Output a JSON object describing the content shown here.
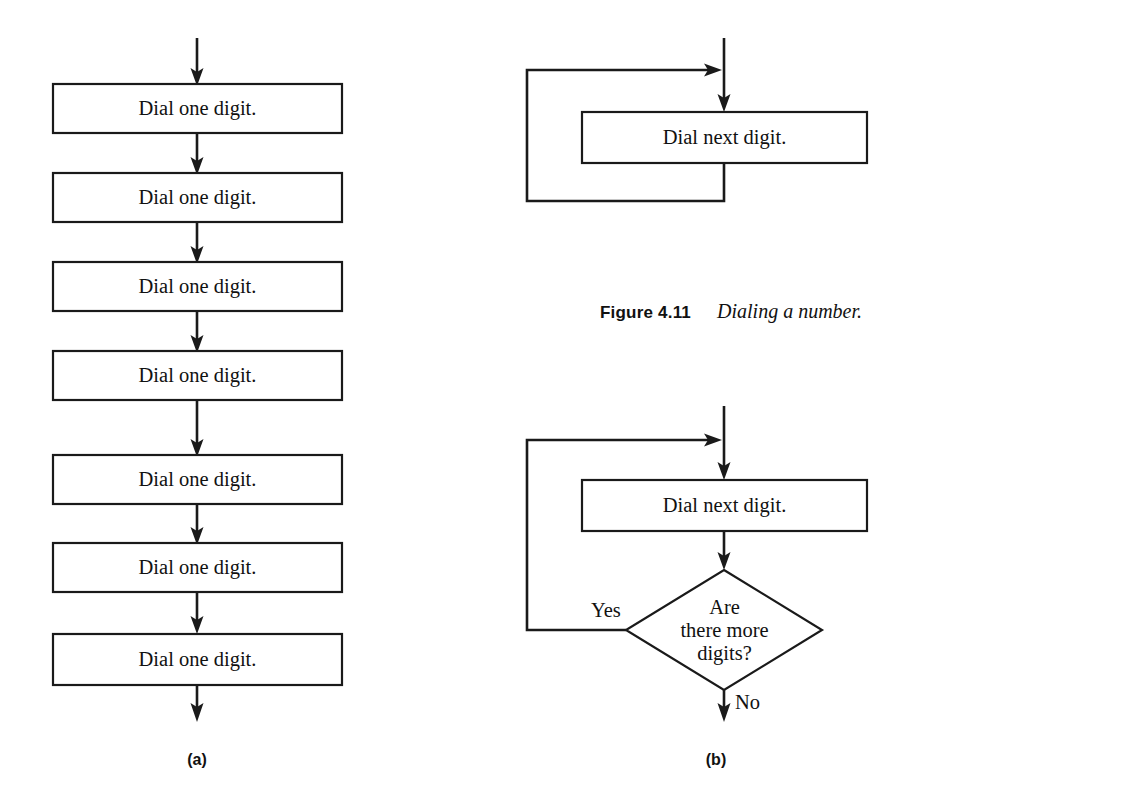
{
  "figure": {
    "caption_number": "Figure 4.11",
    "caption_text": "Dialing a number.",
    "panel_a_label": "(a)",
    "panel_b_label": "(b)"
  },
  "colors": {
    "background": "#ffffff",
    "stroke": "#1a1a1a",
    "text": "#111111"
  },
  "panel_a": {
    "id": "sequential-dialing",
    "node_label": "Dial one digit.",
    "steps": [
      {
        "index": 1,
        "label": "Dial one digit."
      },
      {
        "index": 2,
        "label": "Dial one digit."
      },
      {
        "index": 3,
        "label": "Dial one digit."
      },
      {
        "index": 4,
        "label": "Dial one digit."
      },
      {
        "index": 5,
        "label": "Dial one digit."
      },
      {
        "index": 6,
        "label": "Dial one digit."
      },
      {
        "index": 7,
        "label": "Dial one digit."
      }
    ]
  },
  "panel_b_top": {
    "id": "unconditional-loop",
    "process_label": "Dial next digit."
  },
  "panel_b_bottom": {
    "id": "conditional-loop",
    "process_label": "Dial next digit.",
    "decision_label_line1": "Are",
    "decision_label_line2": "there more",
    "decision_label_line3": "digits?",
    "branch_yes": "Yes",
    "branch_no": "No"
  }
}
